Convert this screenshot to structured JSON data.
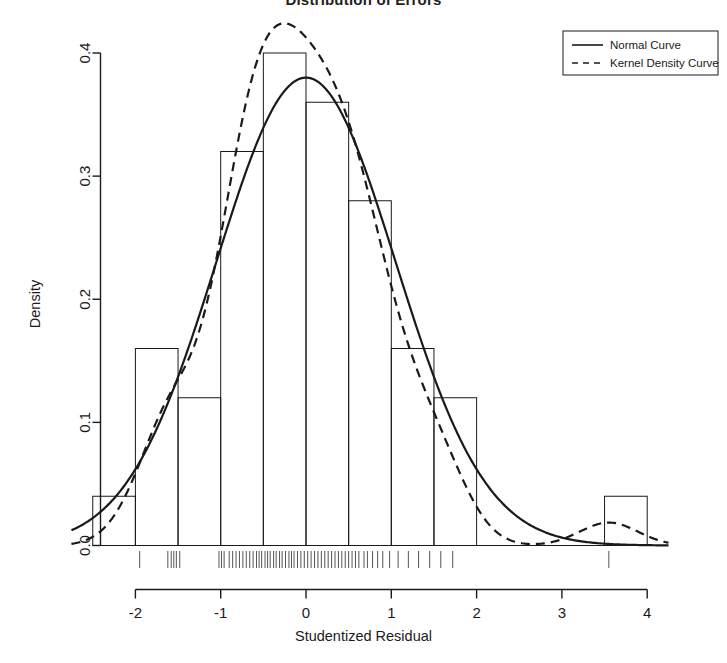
{
  "chart_data": {
    "type": "bar",
    "title": "Distribution of Errors",
    "xlabel": "Studentized Residual",
    "ylabel": "Density",
    "xlim": [
      -2.75,
      4.25
    ],
    "ylim": [
      0.0,
      0.42
    ],
    "xticks": [
      -2,
      -1,
      0,
      1,
      2,
      3,
      4
    ],
    "xticklabels": [
      "-2",
      "-1",
      "0",
      "1",
      "2",
      "3",
      "4"
    ],
    "yticks": [
      0.0,
      0.1,
      0.2,
      0.3,
      0.4
    ],
    "yticklabels": [
      "0.0",
      "0.1",
      "0.2",
      "0.3",
      "0.4"
    ],
    "grid": false,
    "bin_width": 0.5,
    "bin_edges": [
      -2.5,
      -2.0,
      -1.5,
      -1.0,
      -0.5,
      0.0,
      0.5,
      1.0,
      1.5,
      2.0,
      2.5,
      3.0,
      3.5,
      4.0
    ],
    "bin_densities": [
      0.04,
      0.16,
      0.12,
      0.32,
      0.4,
      0.36,
      0.28,
      0.16,
      0.12,
      0.0,
      0.0,
      0.0,
      0.04
    ],
    "series": [
      {
        "name": "Normal Curve",
        "style": "solid",
        "mean": 0.0,
        "sd": 1.05,
        "peak": 0.38
      },
      {
        "name": "Kernel Density Curve",
        "style": "dashed",
        "peak": 0.379,
        "secondary_bump_x": 3.5,
        "secondary_bump_y": 0.035
      }
    ],
    "rug": {
      "present": true,
      "values": [
        -1.95,
        -1.62,
        -1.58,
        -1.55,
        -1.52,
        -1.48,
        -1.02,
        -0.99,
        -0.96,
        -0.9,
        -0.86,
        -0.82,
        -0.78,
        -0.74,
        -0.7,
        -0.66,
        -0.62,
        -0.58,
        -0.55,
        -0.52,
        -0.48,
        -0.45,
        -0.42,
        -0.38,
        -0.35,
        -0.31,
        -0.28,
        -0.24,
        -0.2,
        -0.17,
        -0.14,
        -0.1,
        -0.06,
        -0.02,
        0.02,
        0.06,
        0.1,
        0.14,
        0.18,
        0.22,
        0.26,
        0.3,
        0.34,
        0.38,
        0.42,
        0.46,
        0.5,
        0.54,
        0.58,
        0.62,
        0.68,
        0.72,
        0.78,
        0.84,
        0.9,
        0.98,
        1.08,
        1.2,
        1.32,
        1.45,
        1.58,
        1.72,
        3.55
      ]
    },
    "legend": {
      "position": "top-right",
      "entries": [
        {
          "label": "Normal Curve",
          "style": "solid"
        },
        {
          "label": "Kernel Density Curve",
          "style": "dashed"
        }
      ]
    }
  }
}
